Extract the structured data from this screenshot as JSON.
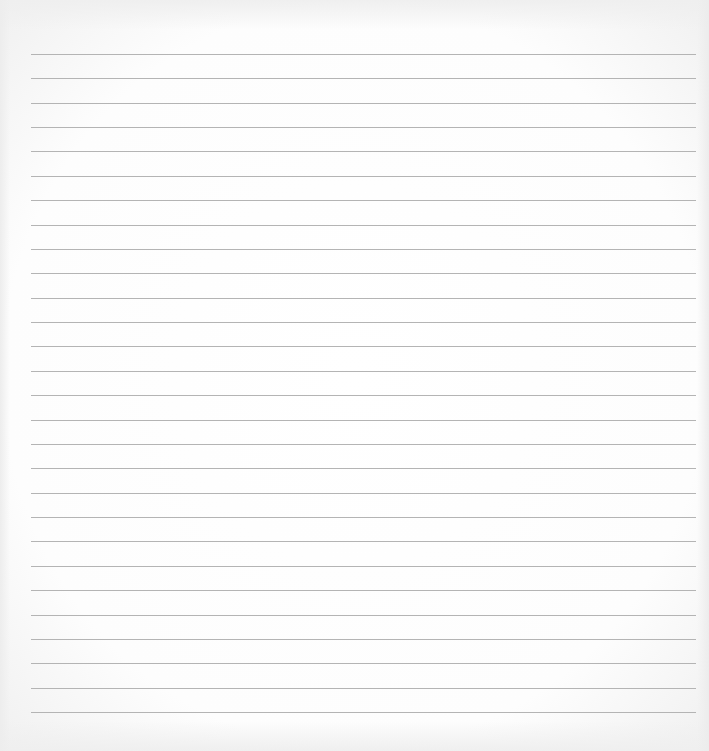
{
  "page": {
    "type": "lined-paper",
    "background_color": "#ffffff",
    "line_color": "#b4b4b4",
    "line_count": 28,
    "line_left": 31,
    "line_width": 665,
    "first_line_y": 54,
    "line_spacing": 24.37
  },
  "text_content": []
}
